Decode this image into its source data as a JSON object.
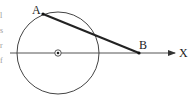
{
  "diagram": {
    "type": "geometry",
    "circle": {
      "cx": 58,
      "cy": 53,
      "r": 41,
      "stroke": "#333333"
    },
    "center_marker": {
      "cx": 58,
      "cy": 53,
      "symbol": "dot-in-circle"
    },
    "axis": {
      "x1": 10,
      "y": 53,
      "x2": 175,
      "label": "X"
    },
    "points": [
      {
        "name": "A",
        "x": 43,
        "y": 14,
        "label": "A"
      },
      {
        "name": "B",
        "x": 139,
        "y": 53,
        "label": "B"
      }
    ],
    "segment": {
      "from": "A",
      "to": "B",
      "stroke": "#222222",
      "width": 2
    }
  },
  "labels": {
    "point_a": "A",
    "point_b": "B",
    "axis_x": "X"
  },
  "left_edge_fragments": [
    "l",
    "s",
    "r",
    "f"
  ]
}
